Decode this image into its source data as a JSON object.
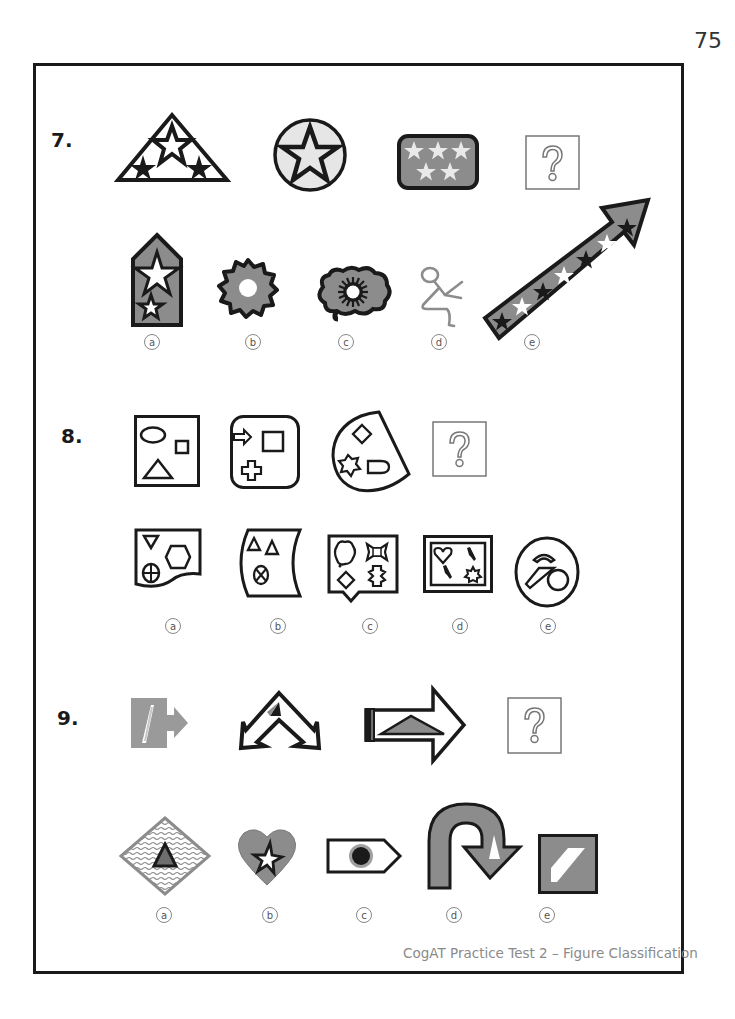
{
  "page": {
    "number": "75",
    "footer": "CogAT Practice Test 2 – Figure Classification"
  },
  "questions": [
    {
      "number": "7.",
      "prompt_figures": [
        "triangle-with-three-stars",
        "circle-with-star",
        "rounded-rectangle-with-five-stars",
        "question-mark-box"
      ],
      "options": [
        {
          "label": "a",
          "figure": "pentagon-badge-with-two-stars"
        },
        {
          "label": "b",
          "figure": "wavy-gear-with-hole"
        },
        {
          "label": "c",
          "figure": "cloud-with-sunburst"
        },
        {
          "label": "d",
          "figure": "stick-figure-sitting"
        },
        {
          "label": "e",
          "figure": "diagonal-arrow-with-stars"
        }
      ]
    },
    {
      "number": "8.",
      "prompt_figures": [
        "square-with-three-shapes",
        "rounded-square-with-three-shapes",
        "sector-with-three-shapes",
        "question-mark-box"
      ],
      "options": [
        {
          "label": "a",
          "figure": "wavy-bottom-card-with-shapes"
        },
        {
          "label": "b",
          "figure": "curved-card-with-shapes"
        },
        {
          "label": "c",
          "figure": "callout-box-with-four-shapes"
        },
        {
          "label": "d",
          "figure": "framed-box-with-four-shapes"
        },
        {
          "label": "e",
          "figure": "oval-with-three-shapes"
        }
      ]
    },
    {
      "number": "9.",
      "prompt_figures": [
        "square-arrow-right-with-triangle",
        "double-chevron-arrow",
        "right-arrow-with-triangle",
        "question-mark-box"
      ],
      "options": [
        {
          "label": "a",
          "figure": "wavy-diamond-with-triangle"
        },
        {
          "label": "b",
          "figure": "heart-with-star"
        },
        {
          "label": "c",
          "figure": "pentagon-tag-with-dot"
        },
        {
          "label": "d",
          "figure": "u-turn-arrow"
        },
        {
          "label": "e",
          "figure": "square-with-parallelogram"
        }
      ]
    }
  ],
  "colors": {
    "outline": "#1a1a1a",
    "gray_fill": "#8c8c8c",
    "light_fill": "#e6e6e6",
    "qmark_stroke": "#777777"
  }
}
